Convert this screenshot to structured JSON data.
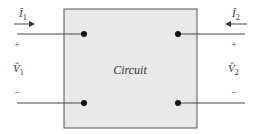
{
  "diagram": {
    "type": "two-port circuit",
    "box_label": "Circuit",
    "colors": {
      "box_fill": "#e9e9e9",
      "box_stroke": "#555555",
      "wire": "#444444",
      "node": "#111111",
      "text": "#333333"
    },
    "port1": {
      "current_label": "Î",
      "current_subscript": "1",
      "current_direction": "into-box",
      "voltage_label": "V̂",
      "voltage_subscript": "1",
      "plus": "+",
      "minus": "−"
    },
    "port2": {
      "current_label": "Î",
      "current_subscript": "2",
      "current_direction": "into-box",
      "voltage_label": "V̂",
      "voltage_subscript": "2",
      "plus": "+",
      "minus": "−"
    }
  }
}
